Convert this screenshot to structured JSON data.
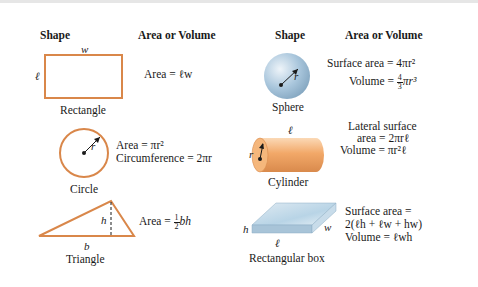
{
  "headers": {
    "left_shape": "Shape",
    "left_area": "Area or Volume",
    "right_shape": "Shape",
    "right_area": "Area or Volume"
  },
  "colors": {
    "shape_outline": "#d9874a",
    "cylinder_fill": "#f2a868",
    "sphere_fill": "#a9c6dc",
    "box_fill": "#b8d4e6"
  },
  "shapes": {
    "rectangle": {
      "name": "Rectangle",
      "dims": {
        "width": "w",
        "length": "ℓ"
      },
      "formulas": [
        "Area = ℓw"
      ]
    },
    "circle": {
      "name": "Circle",
      "dims": {
        "radius": "r"
      },
      "formulas": [
        "Area = πr²",
        "Circumference = 2πr"
      ]
    },
    "triangle": {
      "name": "Triangle",
      "dims": {
        "height": "h",
        "base": "b"
      },
      "formula_prefix": "Area = ",
      "frac_num": "1",
      "frac_den": "2",
      "formula_suffix": "bh"
    },
    "sphere": {
      "name": "Sphere",
      "dims": {
        "radius": "r"
      },
      "formulas": [
        "Surface area = 4πr²"
      ],
      "volume_prefix": "Volume = ",
      "frac_num": "4",
      "frac_den": "3",
      "volume_suffix": "πr³"
    },
    "cylinder": {
      "name": "Cylinder",
      "dims": {
        "radius": "r",
        "length": "ℓ"
      },
      "formulas": [
        "Lateral surface",
        "area = 2πrℓ",
        "Volume = πr²ℓ"
      ]
    },
    "box": {
      "name": "Rectangular box",
      "dims": {
        "height": "h",
        "width": "w",
        "length": "ℓ"
      },
      "formulas": [
        "Surface area =",
        "2(ℓh + ℓw + hw)",
        "Volume = ℓwh"
      ]
    }
  }
}
